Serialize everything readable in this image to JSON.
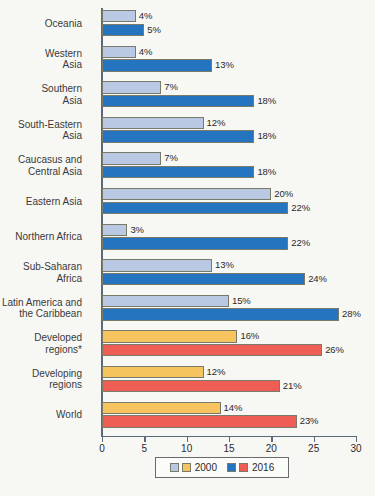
{
  "chart_data": {
    "type": "bar",
    "orientation": "horizontal",
    "title": "",
    "subtitle": "",
    "xlabel": "",
    "ylabel": "",
    "xlim": [
      0,
      30
    ],
    "xticks": [
      0,
      5,
      10,
      15,
      20,
      25,
      30
    ],
    "xtick_labels": [
      "0",
      "5",
      "10",
      "15",
      "20",
      "25",
      "30"
    ],
    "grid": false,
    "value_suffix": "%",
    "legend_position": "bottom",
    "categories": [
      "Oceania",
      "Western\nAsia",
      "Southern\nAsia",
      "South-Eastern\nAsia",
      "Caucasus and\nCentral Asia",
      "Eastern Asia",
      "Northern Africa",
      "Sub-Saharan\nAfrica",
      "Latin America and\nthe Caribbean",
      "Developed\nregions*",
      "Developing\nregions",
      "World"
    ],
    "series": [
      {
        "name": "2000",
        "values": [
          4,
          4,
          7,
          12,
          7,
          20,
          3,
          13,
          15,
          16,
          12,
          14
        ],
        "labels": [
          "4%",
          "4%",
          "7%",
          "12%",
          "7%",
          "20%",
          "3%",
          "13%",
          "15%",
          "16%",
          "12%",
          "14%"
        ]
      },
      {
        "name": "2016",
        "values": [
          5,
          13,
          18,
          18,
          18,
          22,
          22,
          24,
          28,
          26,
          21,
          23
        ],
        "labels": [
          "5%",
          "13%",
          "18%",
          "18%",
          "18%",
          "22%",
          "22%",
          "24%",
          "28%",
          "26%",
          "21%",
          "23%"
        ]
      }
    ],
    "row_colors": [
      "blue",
      "blue",
      "blue",
      "blue",
      "blue",
      "blue",
      "blue",
      "blue",
      "blue",
      "warm",
      "warm",
      "warm"
    ],
    "colors": {
      "series_2000_blue": "#b9c9e3",
      "series_2016_blue": "#2474c0",
      "series_2000_warm": "#f6c45e",
      "series_2016_warm": "#ef5e54",
      "bar_outline": "#7a7a6a",
      "axis": "#5a6a7a",
      "text": "#2a2a2a",
      "background": "#f7f7f4"
    }
  },
  "legend": {
    "entries": [
      {
        "label": "2000",
        "swatches": [
          "#b9c9e3",
          "#f6c45e"
        ]
      },
      {
        "label": "2016",
        "swatches": [
          "#2474c0",
          "#ef5e54"
        ]
      }
    ]
  }
}
